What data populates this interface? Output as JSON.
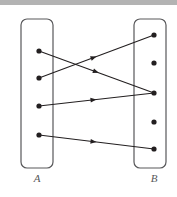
{
  "figure": {
    "type": "bipartite-relation-diagram",
    "background_color": "#ffffff",
    "top_bar_color": "#b3b3b3",
    "line_color": "#231f20",
    "node_color": "#231f20",
    "box_stroke_color": "#58585a",
    "label_color": "#58585a",
    "sets": [
      {
        "id": "A",
        "label": "A",
        "box": {
          "x": 21,
          "y": 19,
          "width": 32,
          "height": 149,
          "radius": 6
        },
        "label_position": {
          "x": 37,
          "y": 178
        },
        "nodes": [
          {
            "id": "a1",
            "x": 39,
            "y": 51,
            "r": 2.6
          },
          {
            "id": "a2",
            "x": 39,
            "y": 78,
            "r": 2.6
          },
          {
            "id": "a3",
            "x": 39,
            "y": 106,
            "r": 2.6
          },
          {
            "id": "a4",
            "x": 39,
            "y": 135,
            "r": 2.6
          }
        ]
      },
      {
        "id": "B",
        "label": "B",
        "box": {
          "x": 134,
          "y": 19,
          "width": 32,
          "height": 149,
          "radius": 6
        },
        "label_position": {
          "x": 154,
          "y": 178
        },
        "nodes": [
          {
            "id": "b1",
            "x": 154,
            "y": 35,
            "r": 2.6
          },
          {
            "id": "b2",
            "x": 154,
            "y": 63,
            "r": 2.6
          },
          {
            "id": "b3",
            "x": 154,
            "y": 93,
            "r": 2.6
          },
          {
            "id": "b4",
            "x": 154,
            "y": 122,
            "r": 2.6
          },
          {
            "id": "b5",
            "x": 154,
            "y": 149,
            "r": 2.6
          }
        ]
      }
    ],
    "edges": [
      {
        "id": "edge-a1-b3",
        "from": "a1",
        "to": "b3",
        "x1": 39,
        "y1": 51,
        "x2": 154,
        "y2": 93,
        "arrow_t": 0.52
      },
      {
        "id": "edge-a2-b1",
        "from": "a2",
        "to": "b1",
        "x1": 39,
        "y1": 78,
        "x2": 154,
        "y2": 35,
        "arrow_t": 0.5
      },
      {
        "id": "edge-a3-b3",
        "from": "a3",
        "to": "b3",
        "x1": 39,
        "y1": 106,
        "x2": 154,
        "y2": 93,
        "arrow_t": 0.5
      },
      {
        "id": "edge-a4-b5",
        "from": "a4",
        "to": "b5",
        "x1": 39,
        "y1": 135,
        "x2": 154,
        "y2": 149,
        "arrow_t": 0.5
      }
    ]
  }
}
